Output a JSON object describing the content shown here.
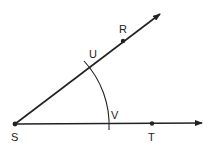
{
  "diagram": {
    "type": "angle-construction",
    "points": {
      "S": {
        "label": "S",
        "x": 15,
        "y": 124
      },
      "R": {
        "label": "R",
        "x": 123,
        "y": 41
      },
      "T": {
        "label": "T",
        "x": 152,
        "y": 124
      },
      "U": {
        "label": "U",
        "x": 89,
        "y": 67
      },
      "V": {
        "label": "V",
        "x": 108,
        "y": 124
      }
    },
    "rays": [
      {
        "name": "ray-SR",
        "from": "S",
        "through": "R"
      },
      {
        "name": "ray-ST",
        "from": "S",
        "through": "T"
      }
    ],
    "arc": {
      "center": "S",
      "from": "U",
      "to": "V"
    },
    "colors": {
      "stroke": "#222222",
      "background": "#ffffff"
    }
  }
}
